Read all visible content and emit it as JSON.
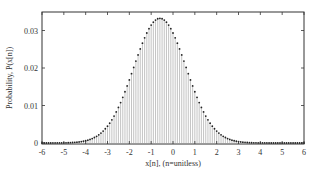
{
  "chart_data": {
    "type": "bar",
    "subtype": "stem",
    "title": "",
    "xlabel": "x[n], (n=unitless)",
    "ylabel": "Probability, P(x[n])",
    "xlim": [
      -6,
      6
    ],
    "ylim": [
      0,
      0.0345
    ],
    "xticks": [
      -6,
      -5,
      -4,
      -3,
      -2,
      -1,
      0,
      1,
      2,
      3,
      4,
      5,
      6
    ],
    "yticks": [
      0,
      0.01,
      0.02,
      0.03
    ],
    "ytick_labels": [
      "0",
      "0.01",
      "0.02",
      "0.03"
    ],
    "grid": false,
    "legend": null,
    "distribution": {
      "shape": "gaussian",
      "mean": -0.6,
      "std": 1.2,
      "step": 0.1,
      "peak": 0.0333
    },
    "x_range": {
      "start": -6,
      "end": 6,
      "step": 0.1
    },
    "colors": {
      "stem": "#9a9a9a",
      "marker": "#222222",
      "axis": "#333333"
    }
  }
}
